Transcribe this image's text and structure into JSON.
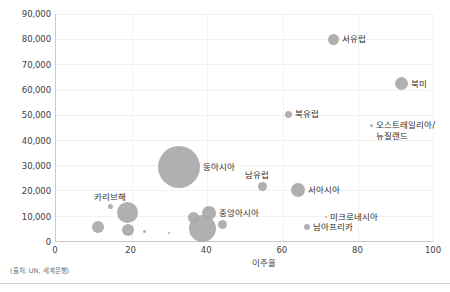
{
  "chart_data": {
    "type": "scatter",
    "title": "",
    "xlabel": "이주율",
    "ylabel": "",
    "xlim": [
      0,
      100
    ],
    "ylim": [
      0,
      90000
    ],
    "xticks": [
      "0",
      "20",
      "40",
      "60",
      "80",
      "100"
    ],
    "yticks": [
      "0",
      "10,000",
      "20,000",
      "30,000",
      "40,000",
      "50,000",
      "60,000",
      "70,000",
      "80,000",
      "90,000"
    ],
    "grid": true,
    "legend": "none",
    "bubble_color": "#a9a9a9",
    "points": [
      {
        "label": "서유럽",
        "x": 73.5,
        "y": 80000,
        "size": 11,
        "label_pos": "right"
      },
      {
        "label": "북미",
        "x": 91.5,
        "y": 62500,
        "size": 13,
        "label_pos": "right"
      },
      {
        "label": "북유럽",
        "x": 61.5,
        "y": 50500,
        "size": 7,
        "label_pos": "right"
      },
      {
        "label": "오스트레일리아/\n뉴질랜드",
        "x": 83.5,
        "y": 46000,
        "size": 3,
        "label_pos": "right"
      },
      {
        "label": "동아시아",
        "x": 32.5,
        "y": 29500,
        "size": 42,
        "label_pos": "right"
      },
      {
        "label": "남유럽",
        "x": 54.5,
        "y": 22000,
        "size": 9,
        "label_pos": "above"
      },
      {
        "label": "서아시아",
        "x": 64.0,
        "y": 20500,
        "size": 14,
        "label_pos": "right"
      },
      {
        "label": "카리브해",
        "x": 14.5,
        "y": 14000,
        "size": 5,
        "label_pos": "above"
      },
      {
        "label": "중앙아시아",
        "x": 40.5,
        "y": 11500,
        "size": 14,
        "label_pos": "right"
      },
      {
        "label": "미크로네시아",
        "x": 71.5,
        "y": 10000,
        "size": 2,
        "label_pos": "right"
      },
      {
        "label": "남아프리카",
        "x": 66.5,
        "y": 6000,
        "size": 6,
        "label_pos": "right"
      }
    ],
    "unlabeled_points": [
      {
        "x": 19.0,
        "y": 11800,
        "size": 21
      },
      {
        "x": 11.0,
        "y": 6000,
        "size": 12
      },
      {
        "x": 19.0,
        "y": 4800,
        "size": 12
      },
      {
        "x": 23.5,
        "y": 4300,
        "size": 3
      },
      {
        "x": 30.0,
        "y": 3600,
        "size": 2
      },
      {
        "x": 36.5,
        "y": 9800,
        "size": 11
      },
      {
        "x": 38.8,
        "y": 5200,
        "size": 27
      },
      {
        "x": 44.0,
        "y": 7000,
        "size": 9
      }
    ]
  },
  "source_note": "(출처: UN, 세계은행)",
  "axis": {
    "x_title": "이주율"
  }
}
